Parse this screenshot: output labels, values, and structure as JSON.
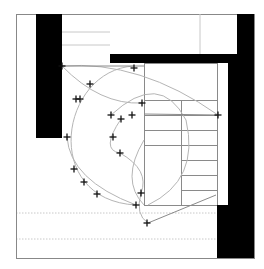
{
  "diagram": {
    "type": "architectural-floor-plan",
    "size": {
      "width": 264,
      "height": 269
    },
    "colors": {
      "background": "#ffffff",
      "wall": "#000000",
      "frame": "#888888",
      "arc": "#b5b5b5",
      "grid": "#8a8a8a",
      "dotted": "#c8c8c8",
      "cross": "#111111"
    },
    "frame": {
      "x": 16,
      "y": 14,
      "w": 238,
      "h": 244
    },
    "walls": [
      {
        "name": "left-wall",
        "x": 36,
        "y": 14,
        "w": 26,
        "h": 124
      },
      {
        "name": "top-bar-wall",
        "x": 110,
        "y": 54,
        "w": 128,
        "h": 9
      },
      {
        "name": "right-upper-wall",
        "x": 237,
        "y": 14,
        "w": 17,
        "h": 49
      },
      {
        "name": "right-middle-wall",
        "x": 228,
        "y": 54,
        "w": 26,
        "h": 151
      },
      {
        "name": "right-lower-wall",
        "x": 217,
        "y": 205,
        "w": 37,
        "h": 53
      }
    ],
    "top_room_lines": [
      {
        "x1": 62,
        "y1": 32,
        "x2": 110,
        "y2": 32
      },
      {
        "x1": 62,
        "y1": 45,
        "x2": 110,
        "y2": 45
      },
      {
        "x1": 200,
        "y1": 14,
        "x2": 200,
        "y2": 54
      }
    ],
    "stairs": {
      "outer": {
        "x": 144,
        "y": 63,
        "w": 73,
        "h": 142
      },
      "divider_x": 181,
      "left_treads_y": [
        100,
        115,
        130,
        145
      ],
      "right_treads_y": [
        100,
        115,
        130,
        145,
        160,
        175,
        190
      ]
    },
    "dotted_lines_y": [
      213,
      239
    ],
    "arcs": [
      {
        "name": "upper-arc",
        "d": "M62 66 Q100 105 142 103"
      },
      {
        "name": "upper-arc-2",
        "d": "M62 66 Q140 60 218 115"
      },
      {
        "name": "big-swing-arc",
        "d": "M134 66 C 60 70, 40 200, 136 205"
      },
      {
        "name": "stair-arc",
        "d": "M111 115 Q 160 70 186 120 Q 200 180 148 205"
      },
      {
        "name": "inner-arc",
        "d": "M121 119 Q 100 150 120 153 Q 150 170 141 193"
      },
      {
        "name": "left-lower-arc",
        "d": "M67 137 Q 70 180 136 205"
      },
      {
        "name": "lower-sweep",
        "d": "M141 193 Q 135 215 148 223"
      },
      {
        "name": "mid-sweep",
        "d": "M144 140 Q 120 180 144 205"
      }
    ],
    "straight_lines": [
      {
        "x1": 62,
        "y1": 66,
        "x2": 144,
        "y2": 66
      },
      {
        "x1": 148,
        "y1": 223,
        "x2": 216,
        "y2": 195
      },
      {
        "x1": 144,
        "y1": 114,
        "x2": 218,
        "y2": 115
      }
    ],
    "crosses": [
      [
        62,
        66
      ],
      [
        90,
        84
      ],
      [
        76,
        99
      ],
      [
        80,
        99
      ],
      [
        134,
        68
      ],
      [
        142,
        103
      ],
      [
        111,
        115
      ],
      [
        121,
        119
      ],
      [
        132,
        115
      ],
      [
        113,
        137
      ],
      [
        120,
        153
      ],
      [
        218,
        115
      ],
      [
        67,
        137
      ],
      [
        74,
        169
      ],
      [
        84,
        182
      ],
      [
        97,
        194
      ],
      [
        141,
        193
      ],
      [
        136,
        205
      ],
      [
        147,
        223
      ]
    ]
  }
}
